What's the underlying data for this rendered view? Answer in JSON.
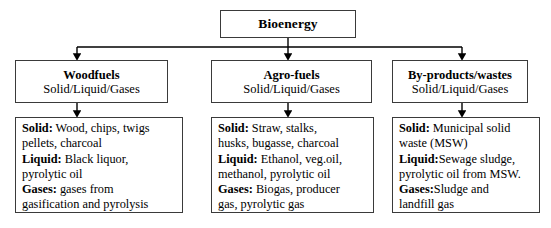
{
  "diagram": {
    "root": {
      "label": "Bioenergy"
    },
    "colors": {
      "box_border": "#3a3a3a",
      "connector": "#000000",
      "background": "#ffffff",
      "text": "#000000"
    },
    "branches": [
      {
        "id": "woodfuels",
        "category": {
          "title": "Woodfuels",
          "subtitle": "Solid/Liquid/Gases"
        },
        "details": [
          {
            "label": "Solid:",
            "lines": [
              "Wood, chips, twigs",
              "pellets, charcoal"
            ]
          },
          {
            "label": "Liquid:",
            "lines": [
              "Black liquor,",
              "pyrolytic oil"
            ]
          },
          {
            "label": "Gases:",
            "lines": [
              "gases from",
              "gasification and pyrolysis"
            ]
          }
        ]
      },
      {
        "id": "agro-fuels",
        "category": {
          "title": "Agro-fuels",
          "subtitle": "Solid/Liquid/Gases"
        },
        "details": [
          {
            "label": "Solid:",
            "lines": [
              "Straw, stalks,",
              "husks, bugasse, charcoal"
            ]
          },
          {
            "label": "Liquid:",
            "lines": [
              "Ethanol, veg.oil,",
              "methanol, pyrolytic oil"
            ]
          },
          {
            "label": "Gases:",
            "lines": [
              "Biogas, producer",
              "gas, pyrolytic gas"
            ]
          }
        ]
      },
      {
        "id": "by-products-wastes",
        "category": {
          "title": "By-products/wastes",
          "subtitle": "Solid/Liquid/Gases"
        },
        "details": [
          {
            "label": "Solid:",
            "lines": [
              "Municipal solid",
              "waste (MSW)"
            ]
          },
          {
            "label": "Liquid:",
            "lines": [
              "Sewage sludge,",
              "pyrolytic oil from MSW."
            ],
            "no_space_after_label": true
          },
          {
            "label": "Gases:",
            "lines": [
              "Sludge and",
              "landfill gas"
            ],
            "no_space_after_label": true
          }
        ]
      }
    ]
  }
}
